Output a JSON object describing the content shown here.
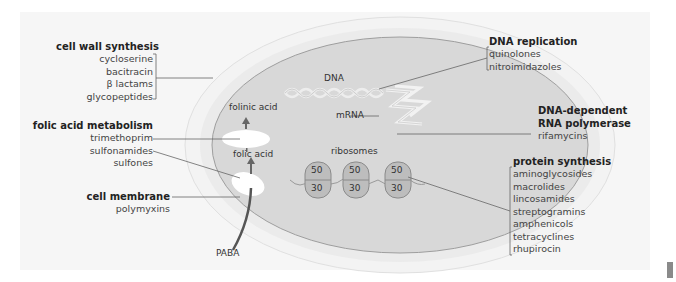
{
  "diagram": {
    "groups": {
      "cell_wall": {
        "title": "cell wall synthesis",
        "items": [
          "cycloserine",
          "bacitracin",
          "β lactams",
          "glycopeptides"
        ]
      },
      "folic_acid": {
        "title": "folic acid metabolism",
        "items": [
          "trimethoprim",
          "sulfonamides",
          "sulfones"
        ]
      },
      "cell_membrane": {
        "title": "cell membrane",
        "items": [
          "polymyxins"
        ]
      },
      "dna_replication": {
        "title": "DNA replication",
        "items": [
          "quinolones",
          "nitroimidazoles"
        ]
      },
      "rna_polymerase": {
        "title_line1": "DNA-dependent",
        "title_line2": "RNA polymerase",
        "items": [
          "rifamycins"
        ]
      },
      "protein_synthesis": {
        "title": "protein synthesis",
        "items": [
          "aminoglycosides",
          "macrolides",
          "lincosamides",
          "streptogramins",
          "amphenicols",
          "tetracyclines",
          "rhupirocin"
        ]
      }
    },
    "cell_labels": {
      "dna": "DNA",
      "mrna": "mRNA",
      "ribosomes": "ribosomes",
      "folinic_acid": "folinic acid",
      "folic_acid": "folic acid",
      "paba": "PABA"
    },
    "ribosomes": [
      {
        "large": "50",
        "small": "30"
      },
      {
        "large": "50",
        "small": "30"
      },
      {
        "large": "50",
        "small": "30"
      }
    ],
    "colors": {
      "outer_wall": "#f2f2f2",
      "membrane": "#e4e4e4",
      "cytoplasm": "#d9d9d9",
      "ribosome": "#bdbdbd",
      "line": "#555555"
    }
  }
}
